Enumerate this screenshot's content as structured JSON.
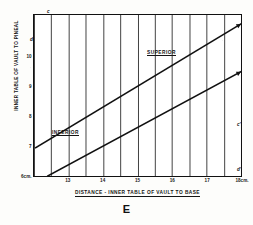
{
  "figure": {
    "caption": "E"
  },
  "axes": {
    "x_title": "DISTANCE - INNER TABLE OF VAULT TO BASE",
    "y_title": "INNER TABLE OF VAULT TO PINEAL"
  },
  "regions": {
    "superior": "SUPERIOR",
    "inferior": "INFERIOR"
  },
  "endpoints": {
    "c": "c",
    "c_prime": "c'",
    "d": "d",
    "d_prime": "d'"
  },
  "chart_data": {
    "type": "line",
    "title": "E",
    "xlabel": "DISTANCE - INNER TABLE OF VAULT TO BASE",
    "ylabel": "INNER TABLE OF VAULT TO PINEAL",
    "xlim": [
      12.0,
      18.0
    ],
    "ylim": [
      11.4,
      6.0
    ],
    "y_inverted": true,
    "grid": true,
    "grid_x_step": 0.5,
    "grid_y_step": 0.5,
    "legend": "none",
    "x_ticks": [
      {
        "value": 13,
        "label": "13"
      },
      {
        "value": 14,
        "label": "14"
      },
      {
        "value": 15,
        "label": "15"
      },
      {
        "value": 16,
        "label": "16"
      },
      {
        "value": 17,
        "label": "17"
      },
      {
        "value": 18,
        "label": "18cm."
      }
    ],
    "y_ticks": [
      {
        "value": 6,
        "label": "6cm."
      },
      {
        "value": 7,
        "label": "7"
      },
      {
        "value": 8,
        "label": "8"
      },
      {
        "value": 9,
        "label": "9"
      },
      {
        "value": 10,
        "label": "10"
      }
    ],
    "series": [
      {
        "name": "c-c'",
        "start_label": "c",
        "end_label": "c'",
        "x": [
          12.4,
          18.0
        ],
        "y": [
          6.0,
          9.5
        ]
      },
      {
        "name": "d-d'",
        "start_label": "d",
        "end_label": "d'",
        "x": [
          12.05,
          18.0
        ],
        "y": [
          6.95,
          11.1
        ]
      }
    ],
    "annotations": [
      {
        "text": "SUPERIOR",
        "x": 15.9,
        "y": 7.2
      },
      {
        "text": "INFERIOR",
        "x": 12.6,
        "y": 9.65
      }
    ]
  }
}
